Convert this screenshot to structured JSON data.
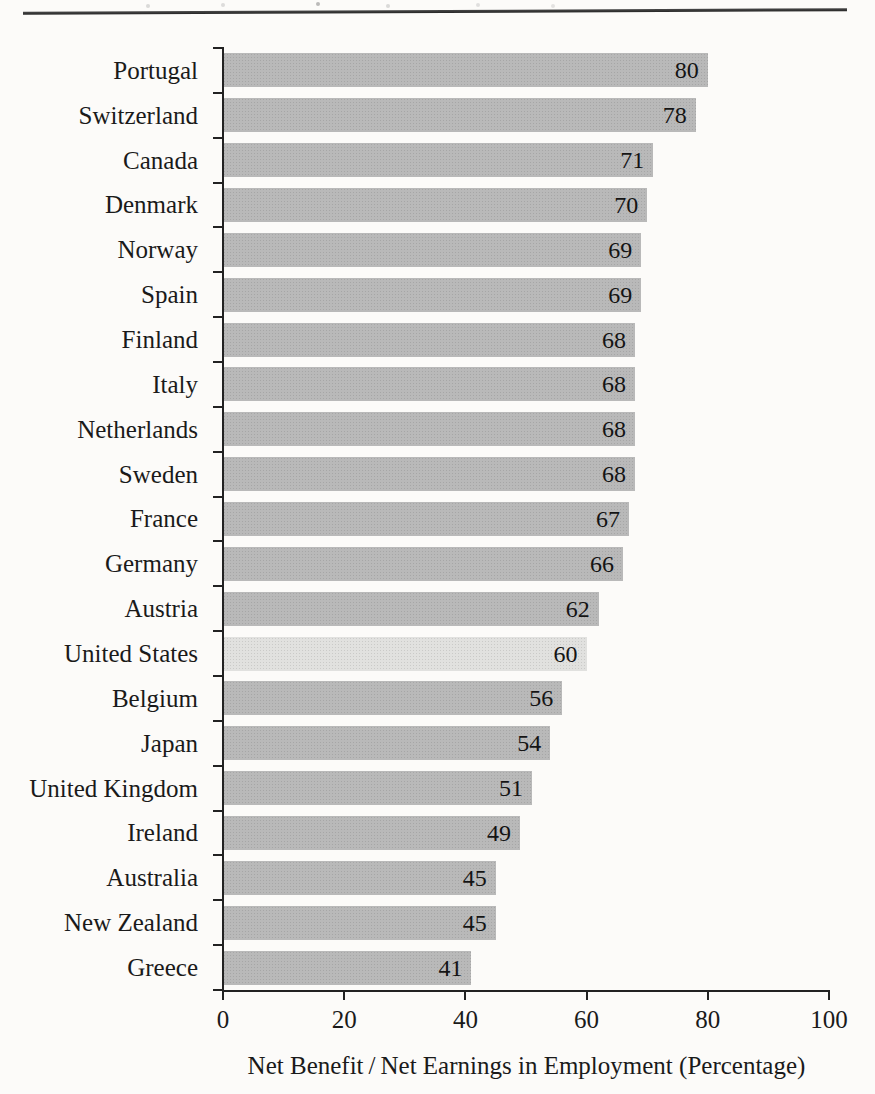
{
  "page": {
    "background_color": "#fcfbf9",
    "top_rule_color": "#343434"
  },
  "chart_data": {
    "type": "bar",
    "orientation": "horizontal",
    "title": "",
    "xlabel": "Net Benefit / Net Earnings in Employment (Percentage)",
    "ylabel": "",
    "xlim": [
      0,
      100
    ],
    "xticks": [
      "0",
      "20",
      "40",
      "60",
      "80",
      "100"
    ],
    "grid": false,
    "bar_color": "#b9b9b9",
    "highlight_bar_color": "#e1e1df",
    "highlighted_category": "United States",
    "axis_color": "#222222",
    "categories": [
      "Portugal",
      "Switzerland",
      "Canada",
      "Denmark",
      "Norway",
      "Spain",
      "Finland",
      "Italy",
      "Netherlands",
      "Sweden",
      "France",
      "Germany",
      "Austria",
      "United States",
      "Belgium",
      "Japan",
      "United Kingdom",
      "Ireland",
      "Australia",
      "New Zealand",
      "Greece"
    ],
    "values": [
      80,
      78,
      71,
      70,
      69,
      69,
      68,
      68,
      68,
      68,
      67,
      66,
      62,
      60,
      56,
      54,
      51,
      49,
      45,
      45,
      41
    ]
  }
}
